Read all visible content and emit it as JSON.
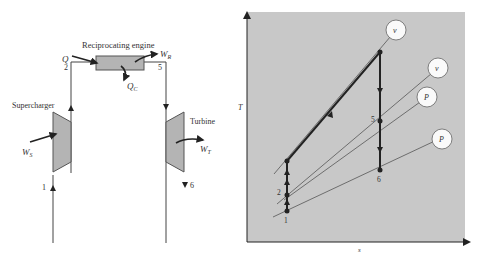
{
  "schematic": {
    "engine_label": "Reciprocating engine",
    "supercharger_label": "Supercharger",
    "turbine_label": "Turbine",
    "heat_in": "Q",
    "heat_out": "Q",
    "heat_out_sub": "C",
    "work_engine": "W",
    "work_engine_sub": "R",
    "work_super": "W",
    "work_super_sub": "S",
    "work_turbine": "W",
    "work_turbine_sub": "T",
    "state_1": "1",
    "state_2": "2",
    "state_5": "5",
    "state_6": "6"
  },
  "ts_diagram": {
    "y_axis_label": "T",
    "x_axis_label": "s",
    "point_1": "1",
    "point_2": "2",
    "point_5": "5",
    "point_6": "6",
    "iso_v_top": "v",
    "iso_v_right": "v",
    "iso_p_mid": "P",
    "iso_p_low": "P"
  },
  "colors": {
    "chart_bg": "#c8c8c8",
    "component_fill": "#b4b4b4",
    "line": "#222222",
    "thin_line": "#555555"
  }
}
